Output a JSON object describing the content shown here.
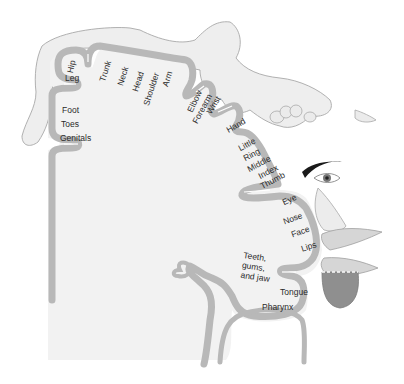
{
  "diagram": {
    "type": "sensory-homunculus",
    "colors": {
      "cortex_fill": "#f1f1f1",
      "gray_matter": "#b8b8b8",
      "sulcus_line": "#ffffff",
      "body_fill": "#eeeeee",
      "body_outline": "#a8a8a8",
      "eyebrow": "#1a1a1a",
      "tongue": "#8f8f8f",
      "text": "#2a2a2a"
    },
    "labels": [
      {
        "id": "hip",
        "text": "Hip"
      },
      {
        "id": "leg",
        "text": "Leg"
      },
      {
        "id": "foot",
        "text": "Foot"
      },
      {
        "id": "toes",
        "text": "Toes"
      },
      {
        "id": "genitals",
        "text": "Genitals"
      },
      {
        "id": "trunk",
        "text": "Trunk"
      },
      {
        "id": "neck",
        "text": "Neck"
      },
      {
        "id": "head",
        "text": "Head"
      },
      {
        "id": "shoulder",
        "text": "Shoulder"
      },
      {
        "id": "arm",
        "text": "Arm"
      },
      {
        "id": "elbow",
        "text": "Elbow"
      },
      {
        "id": "forearm",
        "text": "Forearm"
      },
      {
        "id": "wrist",
        "text": "Wrist"
      },
      {
        "id": "hand",
        "text": "Hand"
      },
      {
        "id": "little",
        "text": "Little"
      },
      {
        "id": "ring",
        "text": "Ring"
      },
      {
        "id": "middle",
        "text": "Middle"
      },
      {
        "id": "index",
        "text": "Index"
      },
      {
        "id": "thumb",
        "text": "Thumb"
      },
      {
        "id": "eye",
        "text": "Eye"
      },
      {
        "id": "nose",
        "text": "Nose"
      },
      {
        "id": "face",
        "text": "Face"
      },
      {
        "id": "lips",
        "text": "Lips"
      },
      {
        "id": "teeth",
        "text": "Teeth,\ngums,\nand jaw"
      },
      {
        "id": "tongue",
        "text": "Tongue"
      },
      {
        "id": "pharynx",
        "text": "Pharynx"
      }
    ]
  }
}
